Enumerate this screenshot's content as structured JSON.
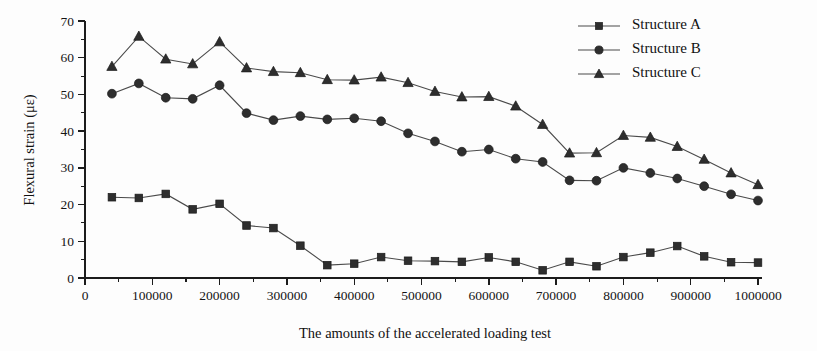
{
  "chart_data": {
    "type": "line",
    "title": "",
    "xlabel": "The amounts of the accelerated loading test",
    "ylabel": "Flexural strain (με)",
    "xlim": [
      0,
      1000000
    ],
    "ylim": [
      0,
      70
    ],
    "xticks": [
      0,
      100000,
      200000,
      300000,
      400000,
      500000,
      600000,
      700000,
      800000,
      900000,
      1000000
    ],
    "xtick_labels": [
      "0",
      "100000",
      "200000",
      "300000",
      "400000",
      "500000",
      "600000",
      "700000",
      "800000",
      "900000",
      "1000000"
    ],
    "yticks": [
      0,
      10,
      20,
      30,
      40,
      50,
      60,
      70
    ],
    "ytick_labels": [
      "0",
      "10",
      "20",
      "30",
      "40",
      "50",
      "60",
      "70"
    ],
    "minor_ticks": true,
    "grid": false,
    "legend_position": "top-right",
    "x": [
      40000,
      80000,
      120000,
      160000,
      200000,
      240000,
      280000,
      320000,
      360000,
      400000,
      440000,
      480000,
      520000,
      560000,
      600000,
      640000,
      680000,
      720000,
      760000,
      800000,
      840000,
      880000,
      920000,
      960000,
      1000000
    ],
    "series": [
      {
        "name": "Structure A",
        "marker": "square",
        "values": [
          22.0,
          21.8,
          22.9,
          18.7,
          20.2,
          14.3,
          13.6,
          8.8,
          3.5,
          3.9,
          5.7,
          4.7,
          4.6,
          4.4,
          5.6,
          4.4,
          2.1,
          4.4,
          3.2,
          5.7,
          6.9,
          8.7,
          5.9,
          4.3,
          4.2
        ]
      },
      {
        "name": "Structure B",
        "marker": "circle",
        "values": [
          50.2,
          53.0,
          49.1,
          48.8,
          52.5,
          44.9,
          43.0,
          44.1,
          43.2,
          43.5,
          42.7,
          39.4,
          37.2,
          34.4,
          35.0,
          32.5,
          31.6,
          26.6,
          26.5,
          30.0,
          28.6,
          27.1,
          25.0,
          22.8,
          21.1
        ]
      },
      {
        "name": "Structure C",
        "marker": "triangle",
        "values": [
          57.6,
          65.8,
          59.6,
          58.3,
          64.3,
          57.2,
          56.2,
          55.9,
          54.0,
          53.9,
          54.7,
          53.2,
          50.8,
          49.3,
          49.4,
          46.8,
          41.8,
          34.0,
          34.1,
          38.8,
          38.3,
          35.8,
          32.3,
          28.6,
          25.4
        ]
      }
    ]
  },
  "legend": {
    "items": [
      {
        "label": "Structure A"
      },
      {
        "label": "Structure B"
      },
      {
        "label": "Structure C"
      }
    ]
  },
  "colors": {
    "marker": "#2e2e2e",
    "line": "#4a4a4a",
    "axis": "#1c1c1c",
    "text": "#111111",
    "background": "#fdfdfd"
  }
}
